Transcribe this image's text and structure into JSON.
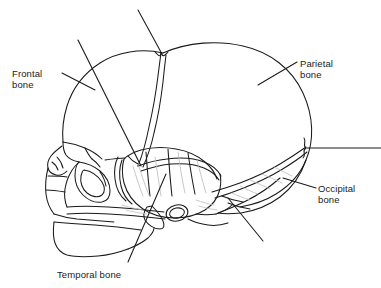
{
  "figure": {
    "type": "anatomical-line-drawing",
    "background_color": "#ffffff",
    "line_color": "#1a1a1a",
    "shading_color": "#b8b8b8"
  },
  "labels": {
    "frontal": {
      "line1": "Frontal",
      "line2": "bone"
    },
    "parietal": {
      "line1": "Parietal",
      "line2": "bone"
    },
    "occipital": {
      "line1": "Occipital",
      "line2": "bone"
    },
    "temporal": {
      "line1": "Temporal bone",
      "line2": ""
    }
  },
  "leader_lines": [
    {
      "name": "frontal-leader",
      "from": [
        62,
        73
      ],
      "to": [
        95,
        90
      ]
    },
    {
      "name": "parietal-leader",
      "from": [
        297,
        62
      ],
      "to": [
        258,
        85
      ]
    },
    {
      "name": "occipital-leader",
      "from": [
        316,
        188
      ],
      "to": [
        283,
        178
      ]
    },
    {
      "name": "temporal-leader",
      "from": [
        128,
        262
      ],
      "to": [
        166,
        174
      ]
    },
    {
      "name": "top-unlabeled-leader",
      "from": [
        138,
        10
      ],
      "to": [
        162,
        54
      ]
    },
    {
      "name": "upper-left-unlabeled-leader",
      "from": [
        78,
        40
      ],
      "to": [
        141,
        166
      ]
    },
    {
      "name": "right-edge-unlabeled-leader",
      "from": [
        381,
        148
      ],
      "to": [
        307,
        148
      ]
    },
    {
      "name": "lower-right-unlabeled-leader",
      "from": [
        263,
        241
      ],
      "to": [
        228,
        198
      ]
    }
  ]
}
